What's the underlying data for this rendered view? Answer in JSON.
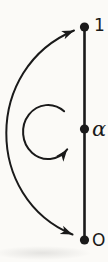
{
  "figure": {
    "background": "#fbfaf7",
    "ink": "#1a1a1a",
    "canvas": {
      "width": 108,
      "height": 262
    },
    "segment": {
      "x": 84.5,
      "y_top": 27,
      "y_bottom": 240,
      "stroke_width": 2.6
    },
    "points": [
      {
        "id": "one",
        "label": "1",
        "x": 84.5,
        "y": 27,
        "r": 4.6,
        "label_x": 94,
        "label_y": 31,
        "italic": false
      },
      {
        "id": "alpha",
        "label": "α",
        "x": 84.5,
        "y": 129,
        "r": 4.6,
        "label_x": 92,
        "label_y": 136,
        "italic": true
      },
      {
        "id": "origin",
        "label": "O",
        "x": 84.5,
        "y": 240,
        "r": 4.6,
        "label_x": 92,
        "label_y": 246,
        "italic": false
      }
    ],
    "arrows": [
      {
        "id": "outer-double-arrow-arc",
        "path": "M 74 30.5 C -16 68, -16 198, 72.5 234.5",
        "stroke_width": 2,
        "head_start": true,
        "head_end": true
      },
      {
        "id": "rotation-loop-arrow",
        "path": "M 64.1 111.3 A 25 27 0 1 0 67.2 149.4",
        "stroke_width": 2,
        "head_start": false,
        "head_end": true
      }
    ]
  }
}
